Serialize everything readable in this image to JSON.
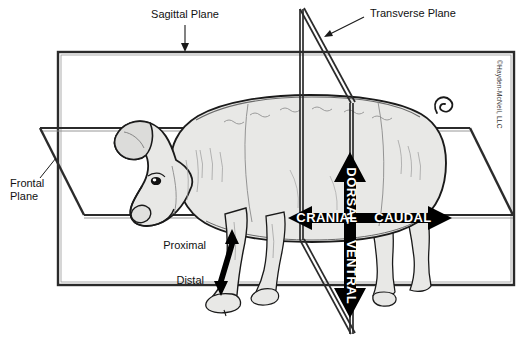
{
  "figure": {
    "background_color": "#ffffff",
    "line_color": "#1a1a1a",
    "body_fill": "#e8e8e6",
    "body_stroke": "#1a1a1a",
    "arrow_fill": "#000000",
    "arrow_label_color": "#ffffff"
  },
  "plane_labels": {
    "sagittal": "Sagittal Plane",
    "transverse": "Transverse Plane",
    "frontal_line1": "Frontal",
    "frontal_line2": "Plane"
  },
  "direction_labels": {
    "dorsal": "DORSAL",
    "ventral": "VENTRAL",
    "cranial": "CRANIAL",
    "caudal": "CAUDAL",
    "proximal": "Proximal",
    "distal": "Distal"
  },
  "credit": {
    "text": "©Hayden-McNeil, LLC"
  }
}
